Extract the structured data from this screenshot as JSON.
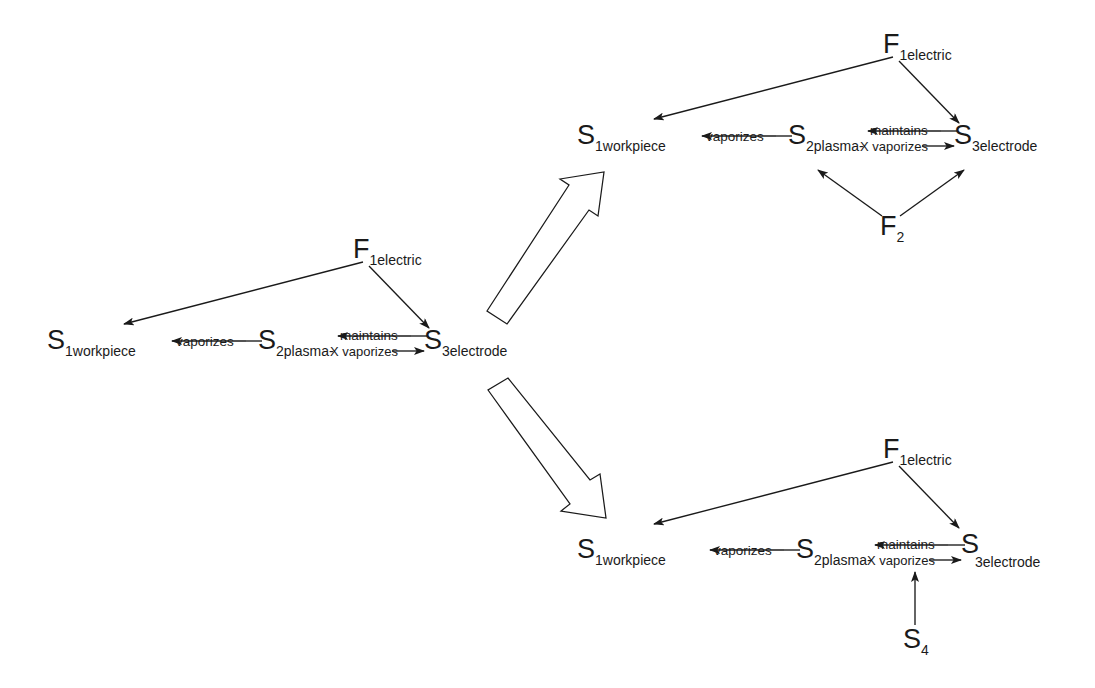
{
  "diagram": {
    "type": "su-field-analysis",
    "clusters": [
      {
        "id": "base",
        "nodes": {
          "field1": {
            "symbol": "F",
            "subscript": "1electric"
          },
          "s1": {
            "symbol": "S",
            "subscript": "1workpiece"
          },
          "s2": {
            "symbol": "S",
            "subscript": "2plasma-"
          },
          "s3": {
            "symbol": "S",
            "subscript": "3electrode"
          }
        },
        "labels": {
          "vaporizes": "vaporizes",
          "maintains": "maintains",
          "x_vaporizes": "X vaporizes"
        }
      },
      {
        "id": "solution-top",
        "nodes": {
          "field1": {
            "symbol": "F",
            "subscript": "1electric"
          },
          "s1": {
            "symbol": "S",
            "subscript": "1workpiece"
          },
          "s2": {
            "symbol": "S",
            "subscript": "2plasma-"
          },
          "s3": {
            "symbol": "S",
            "subscript": "3electrode"
          },
          "field2": {
            "symbol": "F",
            "subscript": "2"
          }
        },
        "labels": {
          "vaporizes": "vaporizes",
          "maintains": "maintains",
          "x_vaporizes": "X vaporizes"
        }
      },
      {
        "id": "solution-bottom",
        "nodes": {
          "field1": {
            "symbol": "F",
            "subscript": "1electric"
          },
          "s1": {
            "symbol": "S",
            "subscript": "1workpiece"
          },
          "s2": {
            "symbol": "S",
            "subscript": "2plasma-"
          },
          "s3": {
            "symbol": "S",
            "subscript": "3electrode"
          },
          "s4": {
            "symbol": "S",
            "subscript": "4"
          }
        },
        "labels": {
          "vaporizes": "vaporizes",
          "maintains": "maintains",
          "x_vaporizes": "X vaporizes"
        }
      }
    ],
    "colors": {
      "stroke": "#1a1a1a",
      "background": "#ffffff"
    }
  }
}
